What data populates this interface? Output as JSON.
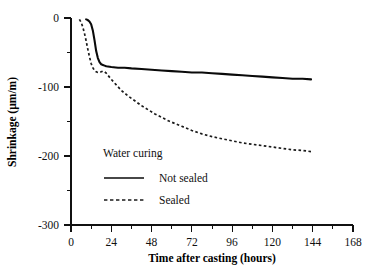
{
  "chart_data": {
    "type": "line",
    "title": "",
    "xlabel": "Time after casting (hours)",
    "ylabel": "Shrinkage (µm/m)",
    "xlim": [
      0,
      168
    ],
    "ylim": [
      -300,
      0
    ],
    "xticks": [
      0,
      24,
      48,
      72,
      96,
      120,
      144,
      168
    ],
    "xtick_labels": [
      "0",
      "24",
      "48",
      "72",
      "96",
      "120",
      "144",
      "168"
    ],
    "yticks": [
      0,
      -100,
      -200,
      -300
    ],
    "ytick_labels": [
      "0",
      "-100",
      "-200",
      "-300"
    ],
    "yticks_minor": [
      -50,
      -150,
      -250
    ],
    "xticks_minor": [
      12,
      36,
      60,
      84,
      108,
      132,
      156
    ],
    "grid": false,
    "legend_title": "Water curing",
    "legend_position": "center-left",
    "series": [
      {
        "name": "Not sealed",
        "style": "solid",
        "color": "#0a0a0a",
        "x": [
          9,
          10,
          11,
          12,
          13,
          14,
          15,
          16,
          17,
          18,
          19,
          20,
          21,
          24,
          28,
          32,
          36,
          42,
          48,
          54,
          60,
          66,
          72,
          78,
          84,
          90,
          96,
          102,
          108,
          114,
          120,
          126,
          132,
          138,
          143
        ],
        "y": [
          -2,
          -3,
          -5,
          -9,
          -18,
          -32,
          -48,
          -58,
          -64,
          -67,
          -68,
          -69,
          -70,
          -71,
          -72,
          -72,
          -73,
          -74,
          -75,
          -76,
          -77,
          -78,
          -79,
          -79,
          -80,
          -81,
          -82,
          -83,
          -84,
          -85,
          -86,
          -87,
          -88,
          -88,
          -89
        ]
      },
      {
        "name": "Sealed",
        "style": "dashed",
        "color": "#1a1a1a",
        "x": [
          5,
          6,
          7,
          8,
          9,
          10,
          11,
          12,
          13,
          14,
          15,
          16,
          17,
          18,
          19,
          20,
          21,
          22,
          24,
          27,
          30,
          34,
          38,
          42,
          46,
          50,
          54,
          58,
          62,
          66,
          72,
          78,
          84,
          90,
          96,
          102,
          108,
          114,
          120,
          126,
          132,
          138,
          144
        ],
        "y": [
          -2,
          -6,
          -13,
          -22,
          -33,
          -45,
          -56,
          -66,
          -72,
          -76,
          -78,
          -79,
          -79,
          -78,
          -77,
          -78,
          -80,
          -83,
          -89,
          -97,
          -105,
          -113,
          -120,
          -127,
          -133,
          -139,
          -144,
          -149,
          -153,
          -157,
          -163,
          -168,
          -172,
          -175,
          -178,
          -181,
          -183,
          -185,
          -187,
          -189,
          -191,
          -192,
          -194
        ]
      }
    ]
  },
  "legend": {
    "title": "Water curing",
    "entries": [
      {
        "label": "Not sealed",
        "style": "solid"
      },
      {
        "label": "Sealed",
        "style": "dashed"
      }
    ]
  }
}
